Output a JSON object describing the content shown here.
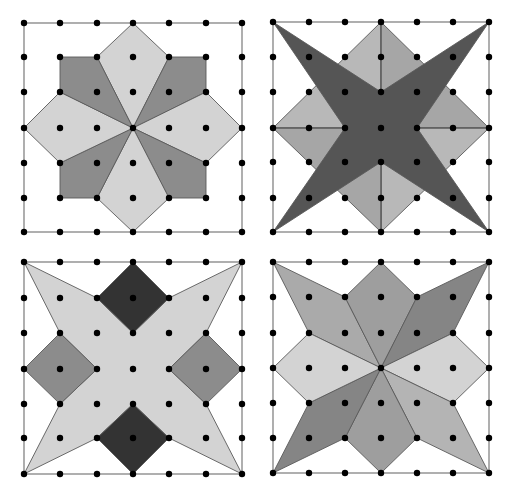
{
  "colors": {
    "background": "#ffffff",
    "frame": "#7a7a7a",
    "dot": "#000000",
    "light": "#d3d3d3",
    "mid": "#8c8c8c",
    "dark_star": "#555555",
    "diamond_light": "#b8b8b8",
    "diamond_mid": "#a6a6a6",
    "very_dark": "#333333",
    "br_spike_a": "#aaaaaa",
    "br_kite": "#9e9e9e",
    "br_spike_dark": "#858585",
    "br_spike_b": "#b4b4b4"
  },
  "panels": [
    {
      "id": "top-left",
      "xs": [
        24,
        60,
        97,
        133,
        169,
        206,
        242
      ],
      "ys": [
        23,
        57,
        92,
        128,
        163,
        198,
        232
      ],
      "pieces": [
        {
          "name": "kite-n",
          "color": "light",
          "pts": [
            [
              3,
              0
            ],
            [
              4,
              1
            ],
            [
              3,
              3
            ],
            [
              2,
              1
            ]
          ]
        },
        {
          "name": "kite-ne",
          "color": "mid",
          "pts": [
            [
              4,
              1
            ],
            [
              5,
              1
            ],
            [
              5,
              2
            ],
            [
              3,
              3
            ]
          ]
        },
        {
          "name": "kite-e",
          "color": "light",
          "pts": [
            [
              5,
              2
            ],
            [
              6,
              3
            ],
            [
              5,
              4
            ],
            [
              3,
              3
            ]
          ]
        },
        {
          "name": "kite-se",
          "color": "mid",
          "pts": [
            [
              5,
              4
            ],
            [
              5,
              5
            ],
            [
              4,
              5
            ],
            [
              3,
              3
            ]
          ]
        },
        {
          "name": "kite-s",
          "color": "light",
          "pts": [
            [
              4,
              5
            ],
            [
              3,
              6
            ],
            [
              2,
              5
            ],
            [
              3,
              3
            ]
          ]
        },
        {
          "name": "kite-sw",
          "color": "mid",
          "pts": [
            [
              2,
              5
            ],
            [
              1,
              5
            ],
            [
              1,
              4
            ],
            [
              3,
              3
            ]
          ]
        },
        {
          "name": "kite-w",
          "color": "light",
          "pts": [
            [
              1,
              4
            ],
            [
              0,
              3
            ],
            [
              1,
              2
            ],
            [
              3,
              3
            ]
          ]
        },
        {
          "name": "kite-nw",
          "color": "mid",
          "pts": [
            [
              1,
              2
            ],
            [
              1,
              1
            ],
            [
              2,
              1
            ],
            [
              3,
              3
            ]
          ]
        }
      ],
      "dividers": []
    },
    {
      "id": "top-right",
      "xs": [
        273,
        309,
        345,
        381,
        417,
        453,
        489
      ],
      "ys": [
        22,
        57,
        92,
        128,
        162,
        198,
        232
      ],
      "pieces": [
        {
          "name": "diamond-tl",
          "color": "diamond_light",
          "pts": [
            [
              3,
              0
            ],
            [
              3,
              3
            ],
            [
              0,
              3
            ]
          ]
        },
        {
          "name": "diamond-tr",
          "color": "diamond_mid",
          "pts": [
            [
              3,
              0
            ],
            [
              6,
              3
            ],
            [
              3,
              3
            ]
          ]
        },
        {
          "name": "diamond-br",
          "color": "diamond_light",
          "pts": [
            [
              6,
              3
            ],
            [
              3,
              6
            ],
            [
              3,
              3
            ]
          ]
        },
        {
          "name": "diamond-bl",
          "color": "diamond_mid",
          "pts": [
            [
              3,
              6
            ],
            [
              0,
              3
            ],
            [
              3,
              3
            ]
          ]
        },
        {
          "name": "dark-star",
          "color": "dark_star",
          "pts": [
            [
              0,
              0
            ],
            [
              3,
              2
            ],
            [
              6,
              0
            ],
            [
              4,
              3
            ],
            [
              6,
              6
            ],
            [
              3,
              4
            ],
            [
              0,
              6
            ],
            [
              2,
              3
            ]
          ]
        }
      ],
      "dividers": [
        [
          [
            0,
            3
          ],
          [
            6,
            3
          ]
        ],
        [
          [
            3,
            0
          ],
          [
            3,
            6
          ]
        ]
      ]
    },
    {
      "id": "bottom-left",
      "xs": [
        24,
        60,
        97,
        133,
        169,
        206,
        242
      ],
      "ys": [
        262,
        298,
        333,
        369,
        404,
        438,
        474
      ],
      "pieces": [
        {
          "name": "light-star",
          "color": "light",
          "pts": [
            [
              0,
              0
            ],
            [
              2,
              1
            ],
            [
              3,
              2
            ],
            [
              4,
              1
            ],
            [
              6,
              0
            ],
            [
              5,
              2
            ],
            [
              4,
              3
            ],
            [
              5,
              4
            ],
            [
              6,
              6
            ],
            [
              4,
              5
            ],
            [
              3,
              4
            ],
            [
              2,
              5
            ],
            [
              0,
              6
            ],
            [
              1,
              4
            ],
            [
              2,
              3
            ],
            [
              1,
              2
            ]
          ]
        },
        {
          "name": "diamond-top",
          "color": "very_dark",
          "pts": [
            [
              3,
              0
            ],
            [
              4,
              1
            ],
            [
              3,
              2
            ],
            [
              2,
              1
            ]
          ]
        },
        {
          "name": "diamond-bottom",
          "color": "very_dark",
          "pts": [
            [
              3,
              4
            ],
            [
              4,
              5
            ],
            [
              3,
              6
            ],
            [
              2,
              5
            ]
          ]
        },
        {
          "name": "diamond-left",
          "color": "mid",
          "pts": [
            [
              1,
              2
            ],
            [
              2,
              3
            ],
            [
              1,
              4
            ],
            [
              0,
              3
            ]
          ]
        },
        {
          "name": "diamond-right",
          "color": "mid",
          "pts": [
            [
              5,
              2
            ],
            [
              6,
              3
            ],
            [
              5,
              4
            ],
            [
              4,
              3
            ]
          ]
        }
      ],
      "dividers": []
    },
    {
      "id": "bottom-right",
      "xs": [
        273,
        309,
        345,
        381,
        417,
        453,
        489
      ],
      "ys": [
        262,
        297,
        333,
        368,
        403,
        438,
        473
      ],
      "pieces": [
        {
          "name": "spike-nw",
          "color": "br_spike_a",
          "pts": [
            [
              0,
              0
            ],
            [
              2,
              1
            ],
            [
              3,
              3
            ],
            [
              1,
              2
            ]
          ]
        },
        {
          "name": "kite-n",
          "color": "br_kite",
          "pts": [
            [
              3,
              0
            ],
            [
              4,
              1
            ],
            [
              3,
              3
            ],
            [
              2,
              1
            ]
          ]
        },
        {
          "name": "spike-ne",
          "color": "br_spike_dark",
          "pts": [
            [
              6,
              0
            ],
            [
              5,
              2
            ],
            [
              3,
              3
            ],
            [
              4,
              1
            ]
          ]
        },
        {
          "name": "kite-e",
          "color": "light",
          "pts": [
            [
              5,
              2
            ],
            [
              6,
              3
            ],
            [
              5,
              4
            ],
            [
              3,
              3
            ]
          ]
        },
        {
          "name": "spike-se",
          "color": "br_spike_b",
          "pts": [
            [
              6,
              6
            ],
            [
              4,
              5
            ],
            [
              3,
              3
            ],
            [
              5,
              4
            ]
          ]
        },
        {
          "name": "kite-s",
          "color": "br_kite",
          "pts": [
            [
              3,
              6
            ],
            [
              2,
              5
            ],
            [
              3,
              3
            ],
            [
              4,
              5
            ]
          ]
        },
        {
          "name": "spike-sw",
          "color": "br_spike_dark",
          "pts": [
            [
              0,
              6
            ],
            [
              1,
              4
            ],
            [
              3,
              3
            ],
            [
              2,
              5
            ]
          ]
        },
        {
          "name": "kite-w",
          "color": "light",
          "pts": [
            [
              1,
              2
            ],
            [
              3,
              3
            ],
            [
              1,
              4
            ],
            [
              0,
              3
            ]
          ]
        }
      ],
      "dividers": []
    }
  ]
}
